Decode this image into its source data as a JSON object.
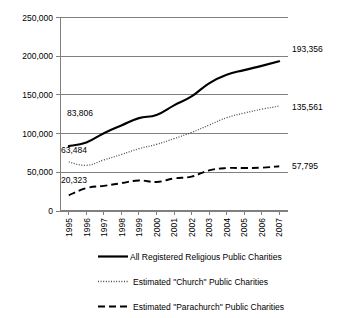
{
  "chart_data": {
    "type": "line",
    "title": "",
    "subtitle": "",
    "xlabel": "",
    "ylabel": "",
    "grid": true,
    "legend_position": "bottom",
    "ylim": [
      0,
      250000
    ],
    "ytick_labels": [
      "250,000",
      "200,000",
      "150,000",
      "100,000",
      "50,000",
      "0"
    ],
    "ytick_values": [
      250000,
      200000,
      150000,
      100000,
      50000,
      0
    ],
    "categories": [
      "1995",
      "1996",
      "1997",
      "1998",
      "1999",
      "2000",
      "2001",
      "2002",
      "2003",
      "2004",
      "2005",
      "2006",
      "2007"
    ],
    "x": [
      1995,
      1996,
      1997,
      1998,
      1999,
      2000,
      2001,
      2002,
      2003,
      2004,
      2005,
      2006,
      2007
    ],
    "series": [
      {
        "name": "All Registered Religious Public Charities",
        "style": "solid",
        "color": "#000000",
        "values": [
          83806,
          88500,
          100500,
          110500,
          120000,
          124000,
          136500,
          148000,
          165000,
          176000,
          182000,
          187500,
          193356
        ]
      },
      {
        "name": "Estimated \"Church\" Public Charities",
        "style": "dotted",
        "color": "#4d4d4d",
        "values": [
          63484,
          59000,
          66000,
          73000,
          80500,
          86000,
          93500,
          101500,
          111000,
          120500,
          126500,
          131500,
          135561
        ]
      },
      {
        "name": "Estimated \"Parachurch\" Public Charities",
        "style": "dashed",
        "color": "#000000",
        "values": [
          20323,
          29500,
          32500,
          36000,
          39500,
          37500,
          42000,
          44500,
          52500,
          55500,
          55500,
          56000,
          57795
        ]
      }
    ],
    "annotations": [
      {
        "text": "83,806",
        "series": "All Registered Religious Public Charities",
        "x": 1995,
        "value": 83806,
        "position": "above-left"
      },
      {
        "text": "63,484",
        "series": "Estimated \"Church\" Public Charities",
        "x": 1995,
        "value": 63484,
        "position": "above-left"
      },
      {
        "text": "20,323",
        "series": "Estimated \"Parachurch\" Public Charities",
        "x": 1995,
        "value": 20323,
        "position": "above-left"
      },
      {
        "text": "193,356",
        "series": "All Registered Religious Public Charities",
        "x": 2007,
        "value": 193356,
        "position": "right"
      },
      {
        "text": "135,561",
        "series": "Estimated \"Church\" Public Charities",
        "x": 2007,
        "value": 135561,
        "position": "right"
      },
      {
        "text": "57,795",
        "series": "Estimated \"Parachurch\" Public Charities",
        "x": 2007,
        "value": 57795,
        "position": "right"
      }
    ]
  },
  "axis": {
    "y_labels": {
      "t0": "250,000",
      "t1": "200,000",
      "t2": "150,000",
      "t3": "100,000",
      "t4": "50,000",
      "t5": "0"
    },
    "x_labels": {
      "y0": "1995",
      "y1": "1996",
      "y2": "1997",
      "y3": "1998",
      "y4": "1999",
      "y5": "2000",
      "y6": "2001",
      "y7": "2002",
      "y8": "2003",
      "y9": "2004",
      "y10": "2005",
      "y11": "2006",
      "y12": "2007"
    }
  },
  "annotations": {
    "start_all": "83,806",
    "start_church": "63,484",
    "start_parachurch": "20,323",
    "end_all": "193,356",
    "end_church": "135,561",
    "end_parachurch": "57,795"
  },
  "legend": {
    "items": [
      {
        "label": "All Registered Religious Public Charities",
        "style": "solid"
      },
      {
        "label": "Estimated \"Church\" Public Charities",
        "style": "dotted"
      },
      {
        "label": "Estimated \"Parachurch\" Public Charities",
        "style": "dashed"
      }
    ]
  }
}
